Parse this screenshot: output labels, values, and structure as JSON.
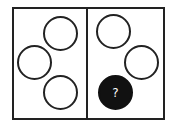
{
  "diagram": {
    "type": "visual-puzzle",
    "panels": [
      {
        "name": "left",
        "circles": [
          {
            "cx": 60,
            "cy": 33,
            "filled": false
          },
          {
            "cx": 34,
            "cy": 62,
            "filled": false
          },
          {
            "cx": 60,
            "cy": 92,
            "filled": false
          }
        ]
      },
      {
        "name": "right",
        "circles": [
          {
            "cx": 113,
            "cy": 31,
            "filled": false
          },
          {
            "cx": 141,
            "cy": 62,
            "filled": false
          },
          {
            "cx": 115,
            "cy": 92,
            "filled": true,
            "label": "?"
          }
        ]
      }
    ],
    "question_mark": "?"
  }
}
